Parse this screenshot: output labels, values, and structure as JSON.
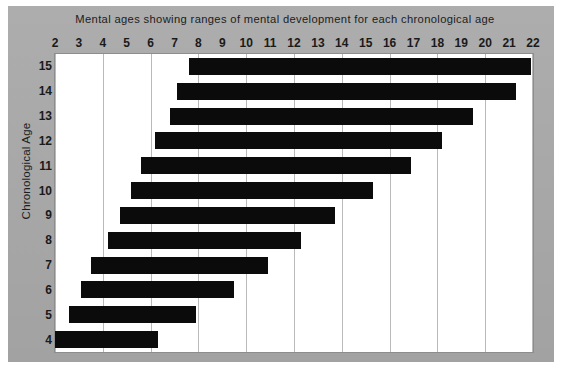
{
  "chart_data": {
    "type": "bar",
    "orientation": "horizontal-range",
    "title": "Mental ages showing ranges of mental development for each chronological age",
    "xlabel": "",
    "ylabel": "Chronological Age",
    "xlim": [
      2,
      22
    ],
    "ylim": [
      3.5,
      15.5
    ],
    "grid": true,
    "grid_axis": "x",
    "grid_step": 2,
    "legend": null,
    "bar_color": "#0b0b0b",
    "plot_background": "#ffffff",
    "figure_background": "#a9a9a9",
    "gridline_color": "#b9b9b9",
    "x_ticks": [
      2,
      3,
      4,
      5,
      6,
      7,
      8,
      9,
      10,
      11,
      12,
      13,
      14,
      15,
      16,
      17,
      18,
      19,
      20,
      21,
      22
    ],
    "x_tick_labels": [
      "2",
      "3",
      "4",
      "5",
      "6",
      "7",
      "8",
      "9",
      "10",
      "11",
      "12",
      "13",
      "14",
      "15",
      "16",
      "17",
      "18",
      "19",
      "20",
      "21",
      "22"
    ],
    "y_ticks": [
      15,
      14,
      13,
      12,
      11,
      10,
      9,
      8,
      7,
      6,
      5,
      4
    ],
    "y_tick_labels": [
      "15",
      "14",
      "13",
      "12",
      "11",
      "10",
      "9",
      "8",
      "7",
      "6",
      "5",
      "4"
    ],
    "categories": [
      "15",
      "14",
      "13",
      "12",
      "11",
      "10",
      "9",
      "8",
      "7",
      "6",
      "5",
      "4"
    ],
    "ranges": [
      {
        "category": "15",
        "start": 7.6,
        "end": 21.9
      },
      {
        "category": "14",
        "start": 7.1,
        "end": 21.3
      },
      {
        "category": "13",
        "start": 6.8,
        "end": 19.5
      },
      {
        "category": "12",
        "start": 6.2,
        "end": 18.2
      },
      {
        "category": "11",
        "start": 5.6,
        "end": 16.9
      },
      {
        "category": "10",
        "start": 5.2,
        "end": 15.3
      },
      {
        "category": "9",
        "start": 4.7,
        "end": 13.7
      },
      {
        "category": "8",
        "start": 4.2,
        "end": 12.3
      },
      {
        "category": "7",
        "start": 3.5,
        "end": 10.9
      },
      {
        "category": "6",
        "start": 3.1,
        "end": 9.5
      },
      {
        "category": "5",
        "start": 2.6,
        "end": 7.9
      },
      {
        "category": "4",
        "start": 2.0,
        "end": 6.3
      }
    ]
  }
}
